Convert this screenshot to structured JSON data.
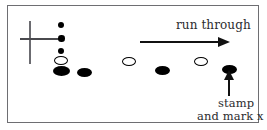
{
  "figure": {
    "background_color": "#ffffff",
    "frame_color": "#6e6e72",
    "ink_color": "#000000"
  },
  "annotations": {
    "run_through": "run through",
    "stamp": "stamp",
    "and_mark_x": "and mark x"
  },
  "cross": {
    "name": "cross-mark",
    "vertical": {
      "x": 29,
      "y": 21,
      "length": 43
    },
    "horizontal": {
      "x": 20,
      "y": 38,
      "length": 44
    }
  },
  "arrows": [
    {
      "name": "run-through-arrow",
      "direction": "right",
      "x": 140,
      "y": 41,
      "length": 80
    },
    {
      "name": "stamp-arrow",
      "direction": "up",
      "x": 228,
      "y": 74,
      "length": 18
    }
  ],
  "marks": [
    {
      "name": "dot-column-1",
      "fill": "filled",
      "x": 58,
      "y": 22,
      "w": 6,
      "h": 6
    },
    {
      "name": "dot-column-2",
      "fill": "filled",
      "x": 58,
      "y": 35,
      "w": 6.5,
      "h": 6.5
    },
    {
      "name": "dot-column-3",
      "fill": "filled",
      "x": 58,
      "y": 48,
      "w": 6,
      "h": 6
    },
    {
      "name": "ellipse-column-hollow",
      "fill": "hollow",
      "x": 54,
      "y": 56,
      "w": 14,
      "h": 9
    },
    {
      "name": "ellipse-column-filled",
      "fill": "filled",
      "x": 53,
      "y": 66,
      "w": 17,
      "h": 10
    },
    {
      "name": "ellipse-row-1",
      "fill": "filled",
      "x": 77,
      "y": 68,
      "w": 15,
      "h": 9
    },
    {
      "name": "ellipse-row-2",
      "fill": "hollow",
      "x": 122,
      "y": 57,
      "w": 14,
      "h": 9
    },
    {
      "name": "ellipse-row-3",
      "fill": "filled",
      "x": 155,
      "y": 66,
      "w": 15,
      "h": 9
    },
    {
      "name": "ellipse-row-4",
      "fill": "hollow",
      "x": 194,
      "y": 57,
      "w": 14,
      "h": 9
    },
    {
      "name": "ellipse-row-5",
      "fill": "filled",
      "x": 222,
      "y": 65,
      "w": 15,
      "h": 9
    }
  ]
}
